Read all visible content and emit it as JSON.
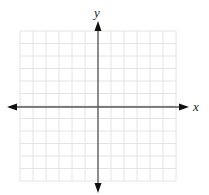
{
  "diagram": {
    "type": "coordinate-plane",
    "x_axis_label": "x",
    "y_axis_label": "y",
    "grid": {
      "left": 20,
      "top": 31,
      "cols": 12,
      "rows": 12,
      "cell_w": 13,
      "cell_h": 12.5,
      "color": "#e4e4e4"
    },
    "axes": {
      "origin_x": 98,
      "origin_y": 107,
      "x_start": 7,
      "x_end": 189,
      "y_start": 21,
      "y_end": 193,
      "color": "#555555",
      "arrow_color": "#111111"
    }
  }
}
